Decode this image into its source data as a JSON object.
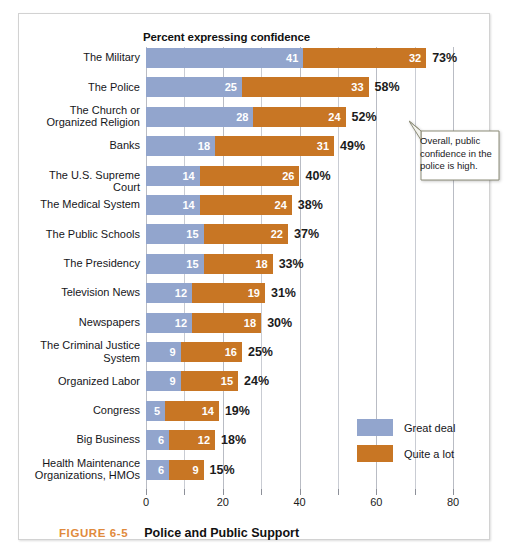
{
  "figure": {
    "caption_number": "FIGURE 6-5",
    "caption_title": "Police and Public Support",
    "number_color": "#e08a3c"
  },
  "callout": {
    "text": "Overall, public confidence in the police is high."
  },
  "chart_data": {
    "type": "bar",
    "orientation": "horizontal",
    "stacked": true,
    "title": "Percent expressing confidence",
    "xlabel": "",
    "ylabel": "",
    "xlim": [
      0,
      80
    ],
    "xticks": [
      0,
      20,
      40,
      60,
      80
    ],
    "xtick_labels": [
      "0",
      "20",
      "40",
      "60",
      "80"
    ],
    "minor_gridlines": [
      10,
      30,
      50,
      70
    ],
    "grid": true,
    "legend_position": "right-lower",
    "colors": {
      "great_deal": "#92a5cd",
      "quite_a_lot": "#c87624"
    },
    "series": [
      {
        "name": "Great deal",
        "color": "#92a5cd",
        "values": [
          41,
          25,
          28,
          18,
          14,
          14,
          15,
          15,
          12,
          12,
          9,
          9,
          5,
          6,
          6
        ]
      },
      {
        "name": "Quite a lot",
        "color": "#c87624",
        "values": [
          32,
          33,
          24,
          31,
          26,
          24,
          22,
          18,
          19,
          18,
          16,
          15,
          14,
          12,
          9
        ]
      }
    ],
    "categories": [
      "The Military",
      "The Police",
      "The Church or\nOrganized Religion",
      "Banks",
      "The U.S. Supreme Court",
      "The Medical System",
      "The Public Schools",
      "The Presidency",
      "Television News",
      "Newspapers",
      "The Criminal Justice\nSystem",
      "Organized Labor",
      "Congress",
      "Big Business",
      "Health Maintenance\nOrganizations, HMOs"
    ],
    "totals": [
      73,
      58,
      52,
      49,
      40,
      38,
      37,
      33,
      31,
      30,
      25,
      24,
      19,
      18,
      15
    ],
    "total_labels": [
      "73%",
      "58%",
      "52%",
      "49%",
      "40%",
      "38%",
      "37%",
      "33%",
      "31%",
      "30%",
      "25%",
      "24%",
      "19%",
      "18%",
      "15%"
    ]
  }
}
